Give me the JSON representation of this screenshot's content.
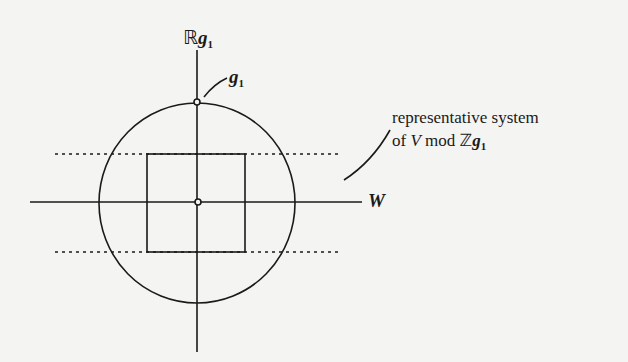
{
  "diagram": {
    "labels": {
      "vertical_axis": {
        "prefix": "ℝ",
        "var": "g",
        "sub": "1"
      },
      "point": {
        "var": "g",
        "sub": "1"
      },
      "horizontal_axis": {
        "var": "W"
      },
      "annotation_line1": "representative system",
      "annotation_line2_prefix": "of ",
      "annotation_line2_V": "V",
      "annotation_line2_mid": " mod ",
      "annotation_line2_Z": "ℤ",
      "annotation_line2_var": "g",
      "annotation_line2_sub": "1"
    },
    "colors": {
      "ink": "#1a1a1a",
      "paper": "#f4f4f2"
    }
  }
}
